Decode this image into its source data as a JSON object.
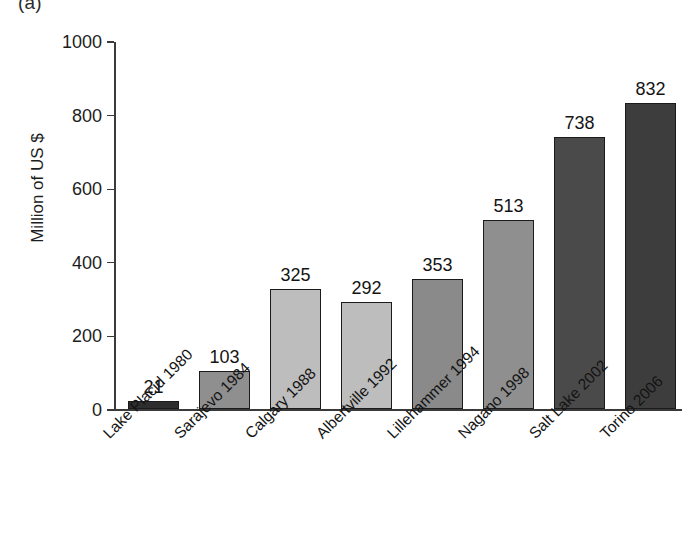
{
  "panel": {
    "letter": "(a)"
  },
  "chart_data": {
    "type": "bar",
    "title": "",
    "subtitle": "",
    "xlabel": "",
    "ylabel": "Million of US $",
    "ylim": [
      0,
      1000
    ],
    "yticks": [
      0,
      200,
      400,
      600,
      800,
      1000
    ],
    "ytick_labels": [
      "0",
      "200",
      "400",
      "600",
      "800",
      "1000"
    ],
    "grid": false,
    "legend": false,
    "legend_position": "none",
    "value_labels_shown": true,
    "categories": [
      "Lake Placid 1980",
      "Sarajevo 1984",
      "Calgary 1988",
      "Albertville 1992",
      "Lillehammer 1994",
      "Nagano 1998",
      "Salt Lake 2002",
      "Torino 2006"
    ],
    "values": [
      21,
      103,
      325,
      292,
      353,
      513,
      738,
      832
    ],
    "value_labels": [
      "21",
      "103",
      "325",
      "292",
      "353",
      "513",
      "738",
      "832"
    ],
    "bar_colors": [
      "#2e2e2e",
      "#8f8f8f",
      "#bdbdbd",
      "#bdbdbd",
      "#8a8a8a",
      "#8f8f8f",
      "#4a4a4a",
      "#3d3d3d"
    ],
    "bar_edge_color": "#1b1b1b",
    "axis_color": "#3a3a3a",
    "background": "#ffffff"
  }
}
